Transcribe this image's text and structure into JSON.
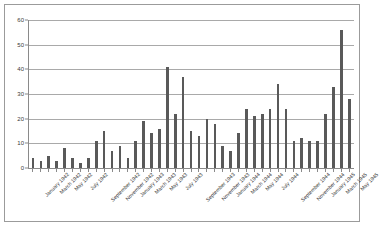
{
  "chart_data": {
    "type": "bar",
    "title": "",
    "subtitle": "",
    "xlabel": "",
    "ylabel": "",
    "ylim": [
      0,
      60
    ],
    "ytick_step": 10,
    "grid": true,
    "gridlines_horizontal": true,
    "gridlines_vertical": false,
    "legend": false,
    "legend_position": "none",
    "bar_color": "#595959",
    "gridline_color": "#a9a9a9",
    "axis_color": "#8a8a8a",
    "frame_color": "#9b9b9b",
    "background_color": "#ffffff",
    "tick_label_rotation": -45,
    "ytick_labels": [
      "60",
      "50",
      "40",
      "30",
      "20",
      "10",
      "0"
    ],
    "ytick_values": [
      60,
      50,
      40,
      30,
      20,
      10,
      0
    ],
    "categories": [
      "January 1942",
      "February 1942",
      "March 1942",
      "April 1942",
      "May 1942",
      "June 1942",
      "July 1942",
      "August 1942",
      "September 1942",
      "October 1942",
      "November 1942",
      "December 1942",
      "January 1943",
      "February 1943",
      "March 1943",
      "April 1943",
      "May 1943",
      "June 1943",
      "July 1943",
      "August 1943",
      "September 1943",
      "October 1943",
      "November 1943",
      "December 1943",
      "January 1944",
      "February 1944",
      "March 1944",
      "April 1944",
      "May 1944",
      "June 1944",
      "July 1944",
      "August 1944",
      "September 1944",
      "October 1944",
      "November 1944",
      "December 1944",
      "January 1945",
      "February 1945",
      "March 1945",
      "April 1945",
      "May 1945"
    ],
    "values": [
      4,
      3,
      5,
      3,
      8,
      4,
      2,
      4,
      11,
      15,
      7,
      9,
      4,
      11,
      19,
      14,
      16,
      41,
      22,
      37,
      15,
      13,
      20,
      18,
      9,
      7,
      14,
      24,
      21,
      22,
      24,
      34,
      24,
      11,
      12,
      11,
      11,
      22,
      33,
      56,
      28
    ],
    "xtick_labels_shown": [
      "January 1942",
      "March 1942",
      "May 1942",
      "July 1942",
      "September 1942",
      "November 1942",
      "January 1943",
      "March 1943",
      "May 1943",
      "July 1943",
      "September 1943",
      "November 1943",
      "January 1944",
      "March 1944",
      "May 1944",
      "July 1944",
      "September 1944",
      "November 1944",
      "January 1945",
      "March 1945",
      "May 1945"
    ]
  }
}
